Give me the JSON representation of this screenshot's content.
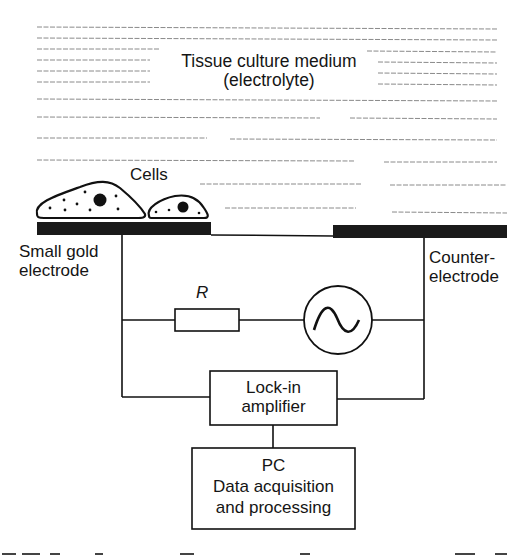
{
  "diagram": {
    "medium_label_line1": "Tissue culture medium",
    "medium_label_line2": "(electrolyte)",
    "cells_label": "Cells",
    "small_electrode_line1": "Small gold",
    "small_electrode_line2": "electrode",
    "counter_electrode_line1": "Counter-",
    "counter_electrode_line2": "electrode",
    "resistor_label": "R",
    "lockin_line1": "Lock-in",
    "lockin_line2": "amplifier",
    "pc_line1": "PC",
    "pc_line2": "Data acquisition",
    "pc_line3": "and processing",
    "colors": {
      "ink": "#151515",
      "electrode": "#1a1a1a",
      "medium_lines": "#8a8a8a",
      "background": "#ffffff"
    },
    "icons": {
      "ac_source": "sine-wave-in-circle",
      "resistor": "rectangle-resistor"
    }
  }
}
